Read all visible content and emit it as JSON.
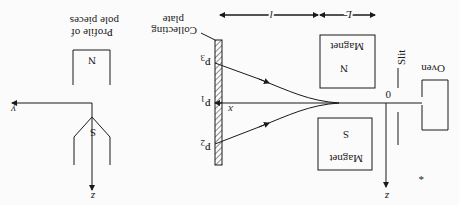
{
  "figure": {
    "orientation": "rotated-180",
    "labels": {
      "oven": "Oven",
      "slit": "Slit",
      "magnet_n": "Magnet",
      "magnet_n_pole": "N",
      "magnet_s": "Magnet",
      "magnet_s_pole": "S",
      "collecting_plate_line1": "Collecting",
      "collecting_plate_line2": "plate",
      "p1": "P",
      "p1_sub": "1",
      "p2": "P",
      "p2_sub": "2",
      "p3": "P",
      "p3_sub": "3",
      "origin": "0",
      "x_axis": "x",
      "z_axis": "z",
      "dim_l": "l",
      "dim_L": "L",
      "profile_line1": "Profile of",
      "profile_line2": "pole pieces",
      "profile_n": "N",
      "profile_s": "S",
      "profile_y_axis": "y",
      "profile_z_axis": "z",
      "oven_mark": "*"
    }
  }
}
